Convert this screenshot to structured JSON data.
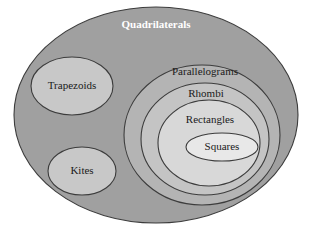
{
  "diagram": {
    "title": "Quadrilaterals",
    "type": "euler-set-diagram",
    "background_color": "#ffffff",
    "outline_color": "#3c3c3c",
    "sets": [
      {
        "id": "quadrilaterals",
        "label": "Quadrilaterals",
        "level": 0,
        "fill": "#a0a0a0",
        "label_color": "#ffffff",
        "cx": 156,
        "cy": 115,
        "rx": 142,
        "ry": 108,
        "label_x": 156,
        "label_y": 25
      },
      {
        "id": "trapezoids",
        "label": "Trapezoids",
        "level": 1,
        "fill": "#c8c8c8",
        "label_color": "#1a1a1a",
        "cx": 72,
        "cy": 86,
        "rx": 41,
        "ry": 29,
        "label_x": 72,
        "label_y": 86
      },
      {
        "id": "kites",
        "label": "Kites",
        "level": 1,
        "fill": "#c8c8c8",
        "label_color": "#1a1a1a",
        "cx": 82,
        "cy": 171,
        "rx": 34,
        "ry": 24,
        "label_x": 82,
        "label_y": 171
      },
      {
        "id": "parallelograms",
        "label": "Parallelograms",
        "level": 1,
        "fill": "#b4b4b4",
        "label_color": "#1a1a1a",
        "cx": 202,
        "cy": 135,
        "rx": 78,
        "ry": 70,
        "label_x": 205,
        "label_y": 72
      },
      {
        "id": "rhombi",
        "label": "Rhombi",
        "level": 2,
        "fill": "#c4c4c4",
        "label_color": "#1a1a1a",
        "cx": 205,
        "cy": 139,
        "rx": 64,
        "ry": 56,
        "label_x": 206,
        "label_y": 94
      },
      {
        "id": "rectangles",
        "label": "Rectangles",
        "level": 3,
        "fill": "#d8d8d8",
        "label_color": "#1a1a1a",
        "cx": 209,
        "cy": 143,
        "rx": 51,
        "ry": 43,
        "label_x": 210,
        "label_y": 120
      },
      {
        "id": "squares",
        "label": "Squares",
        "level": 4,
        "fill": "#e8e8e8",
        "label_color": "#1a1a1a",
        "cx": 222,
        "cy": 147,
        "rx": 36,
        "ry": 14,
        "label_x": 222,
        "label_y": 147
      }
    ]
  }
}
